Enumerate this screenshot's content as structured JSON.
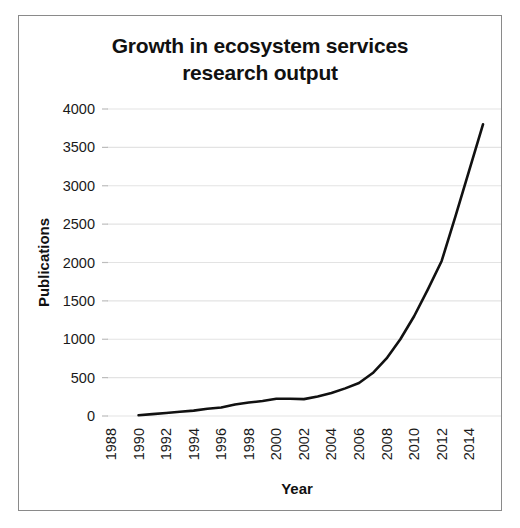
{
  "figure": {
    "title_line_1": "Growth in ecosystem services",
    "title_line_2": "research output",
    "border_color": "#8a8a8a",
    "background": "#ffffff"
  },
  "chart_data": {
    "type": "line",
    "title": "Growth in ecosystem services research output",
    "xlabel": "Year",
    "ylabel": "Publications",
    "xlim": [
      1988,
      2015
    ],
    "ylim": [
      0,
      4000
    ],
    "ytick_step": 500,
    "xtick_step": 2,
    "grid": true,
    "legend": "none",
    "line_color": "#111111",
    "grid_color": "#e3e3e3",
    "xticks": [
      "1988",
      "1990",
      "1992",
      "1994",
      "1996",
      "1998",
      "2000",
      "2002",
      "2004",
      "2006",
      "2008",
      "2010",
      "2012",
      "2014"
    ],
    "yticks": [
      "0",
      "500",
      "1000",
      "1500",
      "2000",
      "2500",
      "3000",
      "3500",
      "4000"
    ],
    "x": [
      1990,
      1991,
      1992,
      1993,
      1994,
      1995,
      1996,
      1997,
      1998,
      1999,
      2000,
      2001,
      2002,
      2003,
      2004,
      2005,
      2006,
      2007,
      2008,
      2009,
      2010,
      2011,
      2012,
      2013,
      2014,
      2015
    ],
    "values": [
      10,
      25,
      40,
      55,
      70,
      95,
      110,
      150,
      175,
      195,
      225,
      225,
      220,
      255,
      300,
      360,
      430,
      560,
      750,
      1000,
      1300,
      1650,
      2020,
      2600,
      3200,
      3800
    ],
    "series": [
      {
        "name": "Publications",
        "values": [
          10,
          25,
          40,
          55,
          70,
          95,
          110,
          150,
          175,
          195,
          225,
          225,
          220,
          255,
          300,
          360,
          430,
          560,
          750,
          1000,
          1300,
          1650,
          2020,
          2600,
          3200,
          3800
        ]
      }
    ]
  }
}
